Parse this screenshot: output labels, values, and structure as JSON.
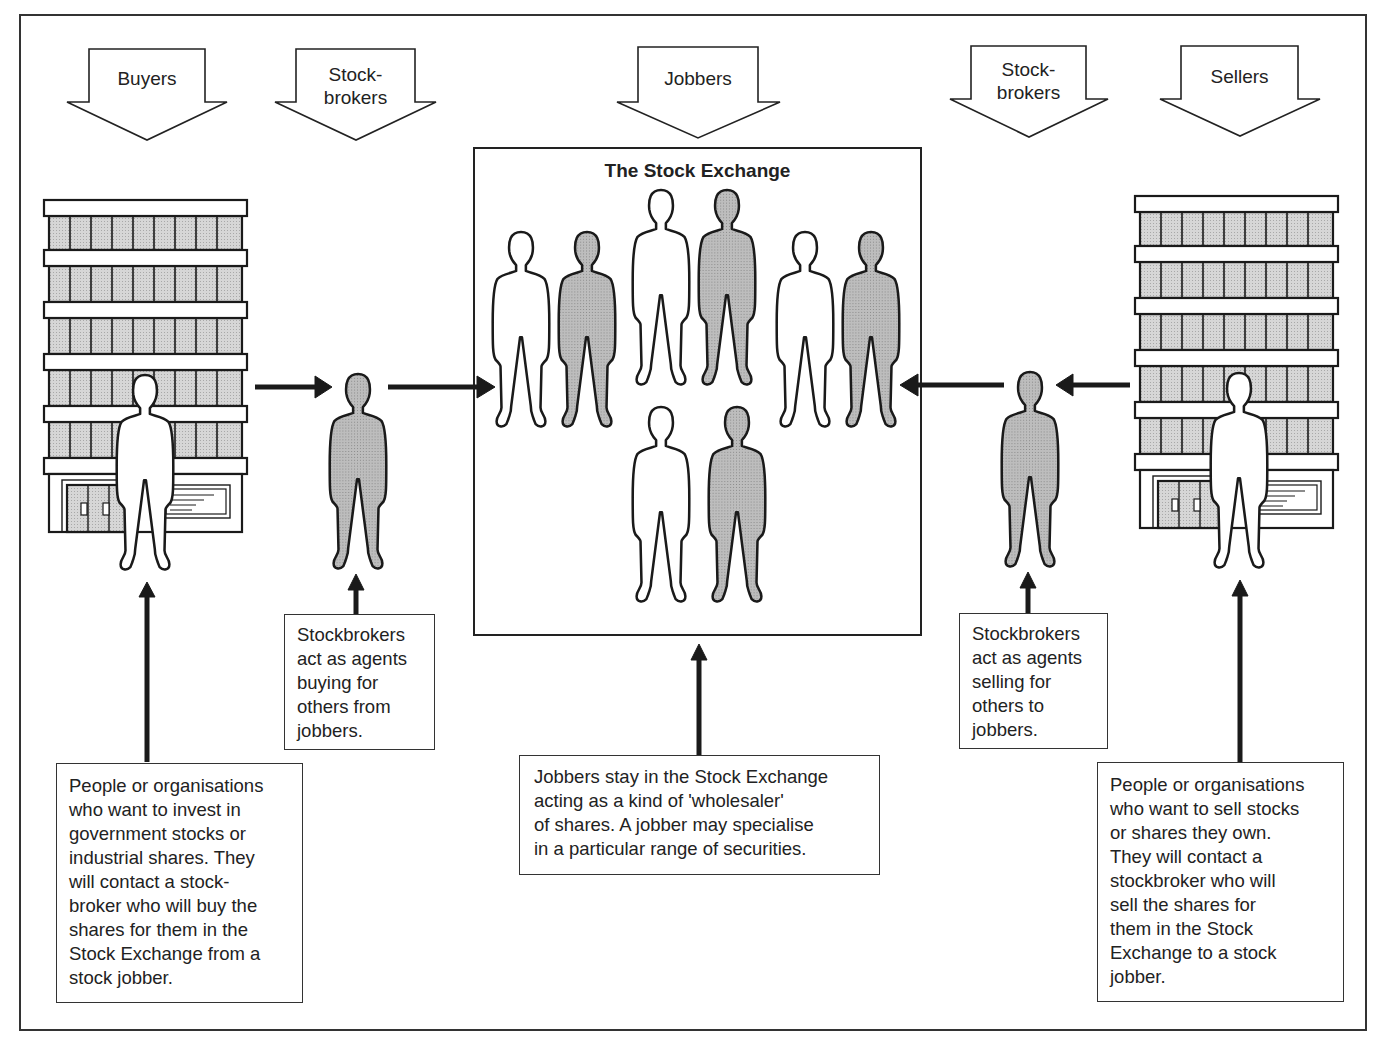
{
  "diagram": {
    "header_arrows": [
      {
        "id": "buyers",
        "label": "Buyers"
      },
      {
        "id": "stockbrokers_left",
        "label": "Stock-\nbrokers"
      },
      {
        "id": "jobbers",
        "label": "Jobbers"
      },
      {
        "id": "stockbrokers_right",
        "label": "Stock-\nbrokers"
      },
      {
        "id": "sellers",
        "label": "Sellers"
      }
    ],
    "exchange": {
      "title": "The Stock Exchange",
      "jobber_figures": 10
    },
    "boxes": {
      "buyers_desc": "People or organisations\nwho want to invest in\ngovernment stocks or\nindustrial shares.  They\nwill contact a stock-\nbroker who will buy the\nshares for them in the\nStock Exchange from a\nstock jobber.",
      "broker_buy_desc": "Stockbrokers\nact as agents\nbuying for\nothers from\njobbers.",
      "jobbers_desc": "Jobbers stay in the Stock Exchange\nacting as a kind of 'wholesaler'\nof shares.  A jobber may specialise\nin a particular range of securities.",
      "broker_sell_desc": "Stockbrokers\nact as agents\nselling for\nothers to\njobbers.",
      "sellers_desc": "People or organisations\nwho want to sell stocks\nor shares they own.\nThey will contact a\nstockbroker who will\nsell the shares for\nthem in the Stock\nExchange to a stock\njobber."
    },
    "flow": [
      "Buyers",
      "Stockbrokers",
      "The Stock Exchange",
      "Stockbrokers",
      "Sellers"
    ],
    "colors": {
      "line": "#222222",
      "fill_gray": "#b4b4b4",
      "window_gray": "#d0d0d0"
    }
  }
}
